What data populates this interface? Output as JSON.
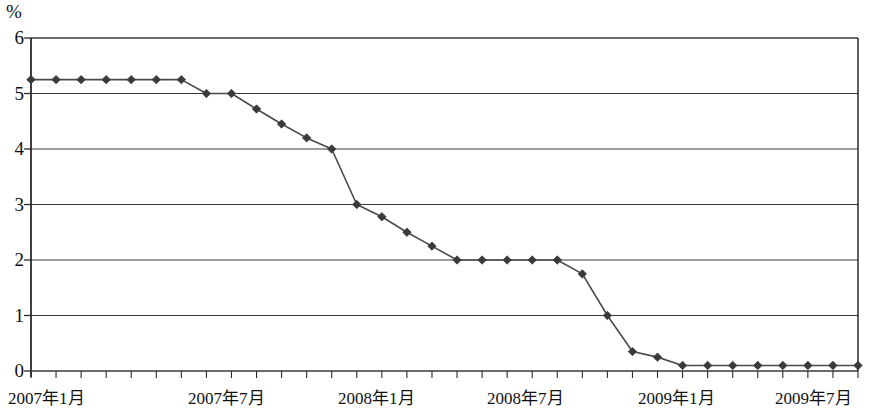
{
  "axis": {
    "unit_label": "%",
    "y_ticks": [
      "0",
      "1",
      "2",
      "3",
      "4",
      "5",
      "6"
    ],
    "x_tick_labels": [
      {
        "text": "2007年1月",
        "x": 8
      },
      {
        "text": "2007年7月",
        "x": 188
      },
      {
        "text": "2008年1月",
        "x": 338
      },
      {
        "text": "2008年7月",
        "x": 487
      },
      {
        "text": "2009年1月",
        "x": 638
      },
      {
        "text": "2009年7月",
        "x": 775
      }
    ]
  },
  "colors": {
    "axis": "#2b2b2b",
    "gridline": "#3a3a3a",
    "line": "#4a4a4a",
    "marker": "#3a3a3a",
    "background": "#ffffff"
  },
  "chart_data": {
    "type": "line",
    "title": "",
    "xlabel": "",
    "ylabel": "%",
    "ylim": [
      0,
      6
    ],
    "y_ticks": [
      0,
      1,
      2,
      3,
      4,
      5,
      6
    ],
    "grid": true,
    "legend": "none",
    "marker": "diamond",
    "x_axis_type": "monthly",
    "x_start": "2007-01",
    "x_end": "2009-10",
    "categories": [
      "2007-01",
      "2007-02",
      "2007-03",
      "2007-04",
      "2007-05",
      "2007-06",
      "2007-07",
      "2007-08",
      "2007-09",
      "2007-10",
      "2007-11",
      "2007-12",
      "2008-01",
      "2008-02",
      "2008-03",
      "2008-04",
      "2008-05",
      "2008-06",
      "2008-07",
      "2008-08",
      "2008-09",
      "2008-10",
      "2008-11",
      "2008-12",
      "2009-01",
      "2009-02",
      "2009-03",
      "2009-04",
      "2009-05",
      "2009-06",
      "2009-07",
      "2009-08",
      "2009-09",
      "2009-10"
    ],
    "values": [
      5.25,
      5.25,
      5.25,
      5.25,
      5.25,
      5.25,
      5.25,
      5.0,
      5.0,
      4.72,
      4.45,
      4.2,
      4.0,
      3.0,
      2.78,
      2.5,
      2.25,
      2.0,
      2.0,
      2.0,
      2.0,
      2.0,
      1.75,
      1.0,
      0.35,
      0.25,
      0.1,
      0.1,
      0.1,
      0.1,
      0.1,
      0.1,
      0.1,
      0.1
    ]
  }
}
